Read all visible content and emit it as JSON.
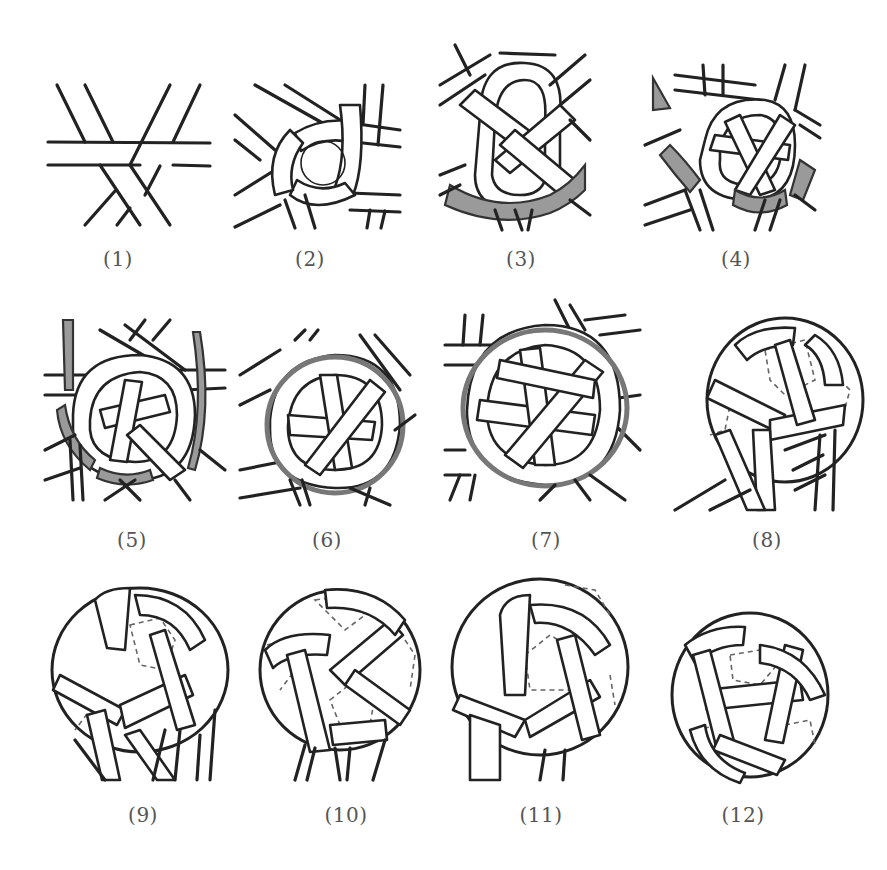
{
  "figure": {
    "panels": [
      {
        "id": 1,
        "label": "(1)",
        "stage": "three crossed strips"
      },
      {
        "id": 2,
        "label": "(2)",
        "stage": "first pentagon forming"
      },
      {
        "id": 3,
        "label": "(3)",
        "stage": "loop with gray strip"
      },
      {
        "id": 4,
        "label": "(4)",
        "stage": "second strip added (gray)"
      },
      {
        "id": 5,
        "label": "(5)",
        "stage": "ring woven around center"
      },
      {
        "id": 6,
        "label": "(6)",
        "stage": "dome shaping"
      },
      {
        "id": 7,
        "label": "(7)",
        "stage": "full ring closed"
      },
      {
        "id": 8,
        "label": "(8)",
        "stage": "ball form with loose ends"
      },
      {
        "id": 9,
        "label": "(9)",
        "stage": "ball tightening"
      },
      {
        "id": 10,
        "label": "(10)",
        "stage": "ball rotated"
      },
      {
        "id": 11,
        "label": "(11)",
        "stage": "nearly closed ball"
      },
      {
        "id": 12,
        "label": "(12)",
        "stage": "finished ball"
      }
    ],
    "colors": {
      "line": "#222222",
      "strip_fill": "#ffffff",
      "highlight_strip": "#9a9a9a",
      "caption": "#555555",
      "background": "#ffffff"
    }
  }
}
